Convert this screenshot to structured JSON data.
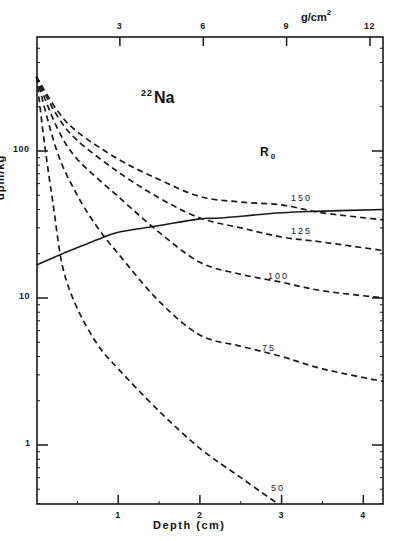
{
  "chart_data": {
    "type": "line",
    "title": "22Na",
    "title_isotope_mass": "22",
    "title_element": "Na",
    "xlabel": "Depth (cm)",
    "ylabel": "dpm/kg",
    "x2label": "g/cm2",
    "x2label_base": "g/cm",
    "x2label_exp": "2",
    "yscale": "log",
    "xlim": [
      0,
      4.25
    ],
    "ylim": [
      0.4,
      600
    ],
    "x_ticks": [
      1,
      2,
      3,
      4
    ],
    "x_tick_labels": [
      "1",
      "2",
      "3",
      "4"
    ],
    "x2_ticks": [
      3,
      6,
      9,
      12
    ],
    "x2_tick_labels": [
      "3",
      "6",
      "9",
      "12"
    ],
    "y_ticks": [
      1,
      10,
      100
    ],
    "y_tick_labels": [
      "1",
      "10",
      "100"
    ],
    "grid": false,
    "legend_title": "R0",
    "legend_title_base": "R",
    "legend_title_sub": "0",
    "series": [
      {
        "name": "150",
        "style": "dashed",
        "x": [
          0,
          0.25,
          0.5,
          1.0,
          1.5,
          2.0,
          2.5,
          3.0,
          3.5,
          4.25
        ],
        "values": [
          320,
          190,
          135,
          88,
          64,
          49,
          45,
          43,
          38,
          34
        ],
        "label_pos": [
          291,
          193
        ]
      },
      {
        "name": "125",
        "style": "dashed",
        "x": [
          0,
          0.25,
          0.5,
          1.0,
          1.5,
          2.0,
          2.5,
          3.0,
          3.5,
          4.25
        ],
        "values": [
          320,
          175,
          118,
          72,
          48,
          35,
          30,
          26,
          24,
          21
        ],
        "label_pos": [
          291,
          226
        ]
      },
      {
        "name": "100",
        "style": "dashed",
        "x": [
          0,
          0.25,
          0.5,
          1.0,
          1.5,
          2.0,
          2.5,
          3.0,
          3.5,
          4.25
        ],
        "values": [
          320,
          145,
          88,
          49,
          28,
          17.5,
          14.5,
          12.8,
          11.2,
          10
        ],
        "label_pos": [
          268,
          271
        ]
      },
      {
        "name": "75",
        "style": "dashed",
        "x": [
          0,
          0.25,
          0.5,
          0.75,
          1.0,
          1.5,
          2.0,
          2.5,
          3.0,
          3.5,
          4.25
        ],
        "values": [
          320,
          100,
          50,
          30,
          20,
          9.5,
          5.6,
          4.7,
          4.0,
          3.3,
          2.7
        ],
        "label_pos": [
          262,
          343
        ]
      },
      {
        "name": "50",
        "style": "dashed",
        "x": [
          0,
          0.1,
          0.2,
          0.32,
          0.5,
          0.75,
          1.0,
          1.5,
          2.0,
          2.5,
          2.95
        ],
        "values": [
          320,
          110,
          45,
          16.3,
          8.5,
          4.8,
          3.3,
          1.7,
          0.95,
          0.6,
          0.4
        ],
        "label_pos": [
          271,
          483
        ]
      },
      {
        "name": "total (solid)",
        "style": "solid",
        "x": [
          0,
          0.32,
          0.75,
          1.0,
          1.41,
          2.0,
          2.25,
          3.0,
          3.5,
          4.25
        ],
        "values": [
          16.8,
          20,
          25,
          28,
          30.5,
          34.5,
          35,
          38,
          39,
          40
        ]
      }
    ]
  }
}
